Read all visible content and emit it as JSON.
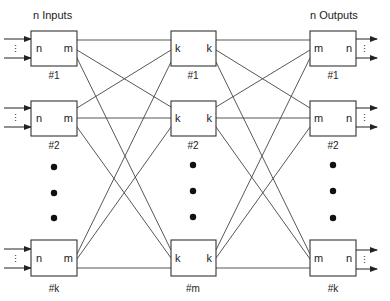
{
  "headers": {
    "inputs": "n  Inputs",
    "outputs": "n  Outputs"
  },
  "stages": {
    "input": {
      "left_port": "n",
      "right_port": "m",
      "labels": [
        "#1",
        "#2",
        "#k"
      ]
    },
    "middle": {
      "left_port": "k",
      "right_port": "k",
      "labels": [
        "#1",
        "#2",
        "#m"
      ]
    },
    "output": {
      "left_port": "m",
      "right_port": "n",
      "labels": [
        "#1",
        "#2",
        "#k"
      ]
    }
  },
  "ellipsis": "⋮",
  "colors": {
    "line": "#444444",
    "box_border": "#333333",
    "background": "#ffffff"
  }
}
